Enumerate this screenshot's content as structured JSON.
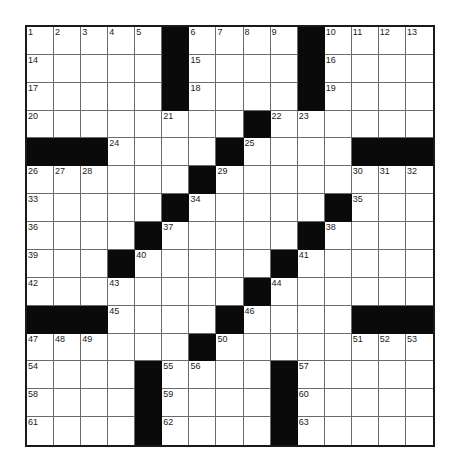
{
  "puzzle": {
    "rows": 15,
    "cols": 15,
    "colors": {
      "block": "#0a0a0a",
      "cell": "#ffffff",
      "line": "#6b6b6b",
      "border": "#1a1a1a"
    },
    "layout": [
      "11111011110111",
      "placeholder"
    ],
    "grid": [
      ".....#....#....",
      ".....#....#....",
      ".....#....#....",
      "........#......",
      "###....#....###",
      "......#........",
      ".....#.....#...",
      "....#.....#....",
      "...#.....#.....",
      "........#......",
      "###....#....###",
      "......#........",
      "....#....#.....",
      "....#....#.....",
      "....#....#....."
    ],
    "numbers": [
      {
        "r": 0,
        "c": 0,
        "n": "1"
      },
      {
        "r": 0,
        "c": 1,
        "n": "2"
      },
      {
        "r": 0,
        "c": 2,
        "n": "3"
      },
      {
        "r": 0,
        "c": 3,
        "n": "4"
      },
      {
        "r": 0,
        "c": 4,
        "n": "5"
      },
      {
        "r": 0,
        "c": 6,
        "n": "6"
      },
      {
        "r": 0,
        "c": 7,
        "n": "7"
      },
      {
        "r": 0,
        "c": 8,
        "n": "8"
      },
      {
        "r": 0,
        "c": 9,
        "n": "9"
      },
      {
        "r": 0,
        "c": 11,
        "n": "10"
      },
      {
        "r": 0,
        "c": 12,
        "n": "11"
      },
      {
        "r": 0,
        "c": 13,
        "n": "12"
      },
      {
        "r": 0,
        "c": 14,
        "n": "13"
      },
      {
        "r": 1,
        "c": 0,
        "n": "14"
      },
      {
        "r": 1,
        "c": 6,
        "n": "15"
      },
      {
        "r": 1,
        "c": 11,
        "n": "16"
      },
      {
        "r": 2,
        "c": 0,
        "n": "17"
      },
      {
        "r": 2,
        "c": 6,
        "n": "18"
      },
      {
        "r": 2,
        "c": 11,
        "n": "19"
      },
      {
        "r": 3,
        "c": 0,
        "n": "20"
      },
      {
        "r": 3,
        "c": 5,
        "n": "21"
      },
      {
        "r": 3,
        "c": 9,
        "n": "22"
      },
      {
        "r": 3,
        "c": 10,
        "n": "23"
      },
      {
        "r": 4,
        "c": 3,
        "n": "24"
      },
      {
        "r": 4,
        "c": 8,
        "n": "25"
      },
      {
        "r": 5,
        "c": 0,
        "n": "26"
      },
      {
        "r": 5,
        "c": 1,
        "n": "27"
      },
      {
        "r": 5,
        "c": 2,
        "n": "28"
      },
      {
        "r": 5,
        "c": 7,
        "n": "29"
      },
      {
        "r": 5,
        "c": 12,
        "n": "30"
      },
      {
        "r": 5,
        "c": 13,
        "n": "31"
      },
      {
        "r": 5,
        "c": 14,
        "n": "32"
      },
      {
        "r": 6,
        "c": 0,
        "n": "33"
      },
      {
        "r": 6,
        "c": 6,
        "n": "34"
      },
      {
        "r": 6,
        "c": 12,
        "n": "35"
      },
      {
        "r": 7,
        "c": 0,
        "n": "36"
      },
      {
        "r": 7,
        "c": 5,
        "n": "37"
      },
      {
        "r": 7,
        "c": 11,
        "n": "38"
      },
      {
        "r": 8,
        "c": 0,
        "n": "39"
      },
      {
        "r": 8,
        "c": 4,
        "n": "40"
      },
      {
        "r": 8,
        "c": 10,
        "n": "41"
      },
      {
        "r": 9,
        "c": 0,
        "n": "42"
      },
      {
        "r": 9,
        "c": 3,
        "n": "43"
      },
      {
        "r": 9,
        "c": 9,
        "n": "44"
      },
      {
        "r": 10,
        "c": 3,
        "n": "45"
      },
      {
        "r": 10,
        "c": 8,
        "n": "46"
      },
      {
        "r": 11,
        "c": 0,
        "n": "47"
      },
      {
        "r": 11,
        "c": 1,
        "n": "48"
      },
      {
        "r": 11,
        "c": 2,
        "n": "49"
      },
      {
        "r": 11,
        "c": 7,
        "n": "50"
      },
      {
        "r": 11,
        "c": 12,
        "n": "51"
      },
      {
        "r": 11,
        "c": 13,
        "n": "52"
      },
      {
        "r": 11,
        "c": 14,
        "n": "53"
      },
      {
        "r": 12,
        "c": 0,
        "n": "54"
      },
      {
        "r": 12,
        "c": 5,
        "n": "55"
      },
      {
        "r": 12,
        "c": 6,
        "n": "56"
      },
      {
        "r": 12,
        "c": 10,
        "n": "57"
      },
      {
        "r": 13,
        "c": 0,
        "n": "58"
      },
      {
        "r": 13,
        "c": 5,
        "n": "59"
      },
      {
        "r": 13,
        "c": 10,
        "n": "60"
      },
      {
        "r": 14,
        "c": 0,
        "n": "61"
      },
      {
        "r": 14,
        "c": 5,
        "n": "62"
      },
      {
        "r": 14,
        "c": 10,
        "n": "63"
      }
    ]
  }
}
